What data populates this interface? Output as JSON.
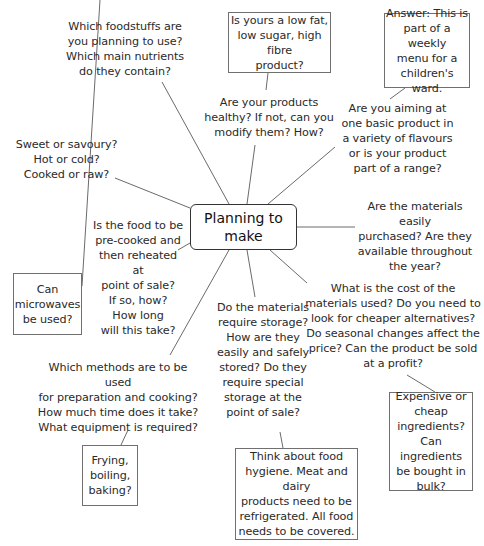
{
  "diagram": {
    "type": "mind-map",
    "center": {
      "label": "Planning to\nmake"
    },
    "nodes": [
      {
        "id": "foodstuffs",
        "text": "Which foodstuffs are\nyou planning to use?\nWhich main nutrients\ndo they contain?",
        "boxed": false
      },
      {
        "id": "low-fat",
        "text": "Is yours a low fat,\nlow sugar, high fibre\nproduct?",
        "boxed": true
      },
      {
        "id": "answer",
        "text": "Answer: This is\npart of a weekly\nmenu for a\nchildren's ward.",
        "boxed": true
      },
      {
        "id": "healthy",
        "text": "Are your products\nhealthy? If not, can you\nmodify them? How?",
        "boxed": false
      },
      {
        "id": "range",
        "text": "Are you aiming at\none basic product in\na variety of flavours\nor is your product\npart of a range?",
        "boxed": false
      },
      {
        "id": "sweet",
        "text": "Sweet or savoury?\nHot or cold?\nCooked or raw?",
        "boxed": false
      },
      {
        "id": "purchased",
        "text": "Are the materials easily\npurchased? Are they\navailable throughout\nthe year?",
        "boxed": false
      },
      {
        "id": "precooked",
        "text": "Is the food to be\npre-cooked and\nthen reheated at\npoint of sale?\nIf so, how?\nHow long\nwill this take?",
        "boxed": false
      },
      {
        "id": "microwaves",
        "text": "Can\nmicrowaves\nbe used?",
        "boxed": true
      },
      {
        "id": "cost",
        "text": "What is the cost of the\nmaterials used? Do you need to\nlook for cheaper alternatives?\nDo seasonal changes affect the\nprice? Can the product be sold\nat a profit?",
        "boxed": false
      },
      {
        "id": "storage",
        "text": "Do the materials\nrequire storage?\nHow are they\neasily and safely\nstored? Do they\nrequire special\nstorage at the\npoint of sale?",
        "boxed": false
      },
      {
        "id": "methods",
        "text": "Which methods are to be used\nfor preparation and cooking?\nHow much time does it take?\nWhat equipment is required?",
        "boxed": false
      },
      {
        "id": "expensive",
        "text": "Expensive or\ncheap\ningredients?\nCan ingredients\nbe bought in\nbulk?",
        "boxed": true
      },
      {
        "id": "frying",
        "text": "Frying,\nboiling,\nbaking?",
        "boxed": true
      },
      {
        "id": "hygiene",
        "text": "Think about food\nhygiene. Meat and dairy\nproducts need to be\nrefrigerated. All food\nneeds to be covered.",
        "boxed": true
      }
    ]
  }
}
